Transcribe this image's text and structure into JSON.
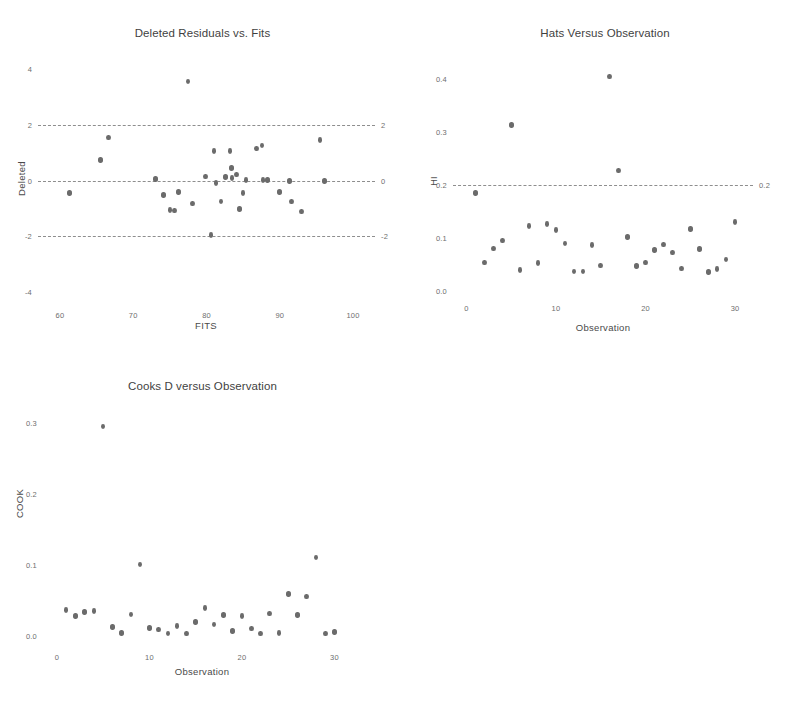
{
  "page": {
    "background": "#ffffff",
    "dot_color": "#6b6b6b",
    "refline_color": "#8e8e8e",
    "text_color": "#3f3f3f"
  },
  "chart_data": [
    {
      "id": "deleted-residuals-vs-fits",
      "type": "scatter",
      "title": "Deleted Residuals vs. Fits",
      "xlabel": "FITS",
      "ylabel": "Deleted",
      "xlim": [
        57,
        103
      ],
      "ylim": [
        -4.4,
        4.4
      ],
      "xticks": [
        60,
        70,
        80,
        90,
        100
      ],
      "xtick_labels": [
        "60",
        "70",
        "80",
        "90",
        "100"
      ],
      "yticks": [
        4,
        2,
        0,
        -2,
        -4
      ],
      "ytick_labels": [
        "4",
        "2",
        "0",
        "-2",
        "-4"
      ],
      "right_ticks": [
        2,
        0,
        -2
      ],
      "right_tick_labels": [
        "2",
        "0",
        "-2"
      ],
      "grid": false,
      "legend": "none",
      "reference_lines": [
        {
          "y": 2,
          "style": "dashed",
          "label": "2"
        },
        {
          "y": 0,
          "style": "dashed",
          "label": "0"
        },
        {
          "y": -2,
          "style": "dashed",
          "label": "-2"
        }
      ],
      "x": [
        61.3,
        65.5,
        66.6,
        73.0,
        74.1,
        75.0,
        75.6,
        76.2,
        77.5,
        78.1,
        79.9,
        80.6,
        81.0,
        81.3,
        82.0,
        82.6,
        83.2,
        83.4,
        83.5,
        84.1,
        84.5,
        85.0,
        85.4,
        86.8,
        87.6,
        87.7,
        88.3,
        90.0,
        91.3,
        91.6,
        93.0,
        95.5,
        96.1
      ],
      "y": [
        -0.45,
        0.73,
        1.55,
        0.06,
        -0.52,
        -1.05,
        -1.08,
        -0.42,
        3.55,
        -0.82,
        0.15,
        -1.95,
        1.05,
        -0.1,
        -0.75,
        0.13,
        1.05,
        0.45,
        0.1,
        0.22,
        -1.02,
        -0.45,
        0.02,
        1.15,
        1.25,
        0.02,
        0.02,
        -0.42,
        -0.02,
        -0.75,
        -1.12,
        1.45,
        -0.02
      ]
    },
    {
      "id": "hats-versus-observation",
      "type": "scatter",
      "title": "Hats Versus Observation",
      "xlabel": "Observation",
      "ylabel": "HI",
      "xlim": [
        -1.5,
        32
      ],
      "ylim": [
        -0.01,
        0.44
      ],
      "xticks": [
        0,
        10,
        20,
        30
      ],
      "xtick_labels": [
        "0",
        "10",
        "20",
        "30"
      ],
      "yticks": [
        0.4,
        0.3,
        0.2,
        0.1,
        0.0
      ],
      "ytick_labels": [
        "0.4",
        "0.3",
        "0.2",
        "0.1",
        "0.0"
      ],
      "right_ticks": [
        0.2
      ],
      "right_tick_labels": [
        "0.2"
      ],
      "grid": false,
      "legend": "none",
      "reference_lines": [
        {
          "y": 0.2,
          "style": "dashed",
          "label": "0.2"
        }
      ],
      "x": [
        1,
        2,
        3,
        4,
        5,
        6,
        7,
        8,
        9,
        10,
        11,
        12,
        13,
        14,
        15,
        16,
        17,
        18,
        19,
        20,
        21,
        22,
        23,
        24,
        25,
        26,
        27,
        28,
        29,
        30
      ],
      "y": [
        0.185,
        0.053,
        0.08,
        0.095,
        0.313,
        0.039,
        0.122,
        0.052,
        0.126,
        0.115,
        0.089,
        0.036,
        0.036,
        0.086,
        0.048,
        0.405,
        0.227,
        0.101,
        0.047,
        0.053,
        0.077,
        0.087,
        0.072,
        0.042,
        0.117,
        0.079,
        0.035,
        0.041,
        0.059,
        0.13
      ]
    },
    {
      "id": "cooks-d-versus-observation",
      "type": "scatter",
      "title": "Cooks D versus Observation",
      "xlabel": "Observation",
      "ylabel": "COOK",
      "xlim": [
        -1.5,
        32
      ],
      "ylim": [
        -0.012,
        0.325
      ],
      "xticks": [
        0,
        10,
        20,
        30
      ],
      "xtick_labels": [
        "0",
        "10",
        "20",
        "30"
      ],
      "yticks": [
        0.3,
        0.2,
        0.1,
        0.0
      ],
      "ytick_labels": [
        "0.3",
        "0.2",
        "0.1",
        "0.0"
      ],
      "right_ticks": [],
      "right_tick_labels": [],
      "grid": false,
      "legend": "none",
      "reference_lines": [],
      "x": [
        1,
        2,
        3,
        4,
        5,
        6,
        7,
        8,
        9,
        10,
        11,
        12,
        13,
        14,
        15,
        16,
        17,
        18,
        19,
        20,
        21,
        22,
        23,
        24,
        25,
        26,
        27,
        28,
        29,
        30
      ],
      "y": [
        0.037,
        0.029,
        0.034,
        0.036,
        0.295,
        0.013,
        0.005,
        0.031,
        0.101,
        0.012,
        0.01,
        0.004,
        0.015,
        0.004,
        0.02,
        0.04,
        0.017,
        0.03,
        0.008,
        0.029,
        0.011,
        0.004,
        0.032,
        0.005,
        0.06,
        0.03,
        0.056,
        0.111,
        0.004,
        0.006
      ]
    }
  ]
}
